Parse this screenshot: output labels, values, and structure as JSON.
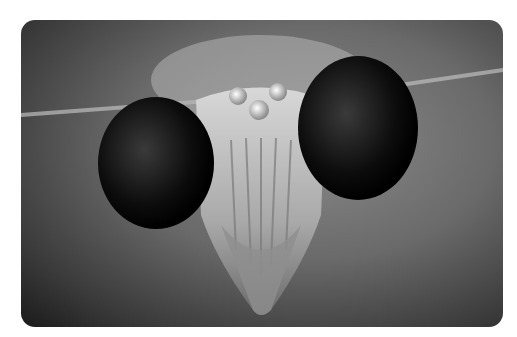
{
  "image": {
    "subject": "Close-up grayscale photograph of a praying mantis head facing the camera",
    "alt": "Praying mantis head close-up"
  }
}
